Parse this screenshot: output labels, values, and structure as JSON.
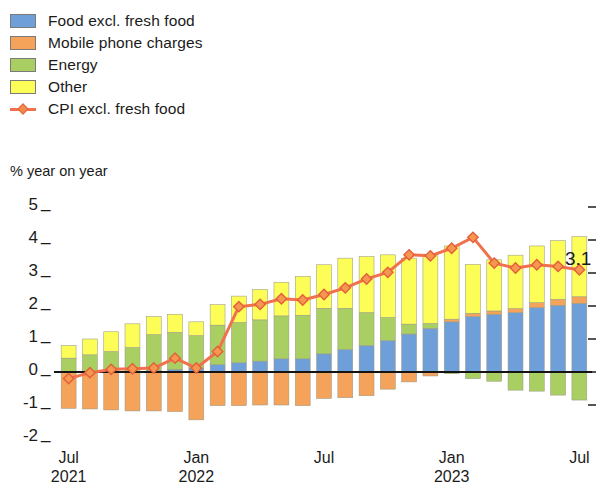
{
  "legend": {
    "items": [
      {
        "label": "Food excl. fresh food",
        "color": "#6f9fd8",
        "type": "swatch",
        "icon": "square-swatch-icon"
      },
      {
        "label": "Mobile phone charges",
        "color": "#f5a25a",
        "type": "swatch",
        "icon": "square-swatch-icon"
      },
      {
        "label": "Energy",
        "color": "#a9cf63",
        "type": "swatch",
        "icon": "square-swatch-icon"
      },
      {
        "label": "Other",
        "color": "#fdfd57",
        "type": "swatch",
        "icon": "square-swatch-icon"
      },
      {
        "label": "CPI excl. fresh food",
        "color": "#f0714c",
        "type": "line",
        "icon": "line-marker-icon"
      }
    ]
  },
  "chart_data": {
    "type": "bar",
    "subtype": "stacked-bar-with-line-overlay",
    "title": "",
    "subtitle": "",
    "ylabel": "% year on year",
    "xlabel": "",
    "ylim": [
      -2,
      5
    ],
    "yticks": [
      -2,
      -1,
      0,
      1,
      2,
      3,
      4,
      5
    ],
    "ytick_labels": [
      "-2",
      "-1",
      "0",
      "1",
      "2",
      "3",
      "4",
      "5"
    ],
    "grid": false,
    "zero_line": true,
    "legend_position": "top-left",
    "x": [
      "2021-07",
      "2021-08",
      "2021-09",
      "2021-10",
      "2021-11",
      "2021-12",
      "2022-01",
      "2022-02",
      "2022-03",
      "2022-04",
      "2022-05",
      "2022-06",
      "2022-07",
      "2022-08",
      "2022-09",
      "2022-10",
      "2022-11",
      "2022-12",
      "2023-01",
      "2023-02",
      "2023-03",
      "2023-04",
      "2023-05",
      "2023-06",
      "2023-07"
    ],
    "xtick_positions": [
      0,
      6,
      12,
      18,
      24
    ],
    "xtick_labels": [
      {
        "month": "Jul",
        "year": "2021"
      },
      {
        "month": "Jan",
        "year": "2022"
      },
      {
        "month": "Jul",
        "year": ""
      },
      {
        "month": "Jan",
        "year": "2023"
      },
      {
        "month": "Jul",
        "year": ""
      }
    ],
    "series": [
      {
        "name": "Food excl. fresh food",
        "color": "#6f9fd8",
        "values": [
          0.0,
          0.0,
          0.0,
          0.02,
          0.05,
          0.08,
          0.12,
          0.22,
          0.28,
          0.33,
          0.4,
          0.4,
          0.55,
          0.68,
          0.8,
          0.95,
          1.15,
          1.32,
          1.52,
          1.68,
          1.75,
          1.8,
          1.95,
          2.02,
          2.08
        ]
      },
      {
        "name": "Mobile phone charges",
        "color": "#f5a25a",
        "values": [
          -1.1,
          -1.12,
          -1.15,
          -1.18,
          -1.18,
          -1.2,
          -1.45,
          -1.02,
          -1.02,
          -1.0,
          -1.0,
          -1.02,
          -0.8,
          -0.78,
          -0.72,
          -0.52,
          -0.3,
          -0.12,
          0.08,
          0.1,
          0.1,
          0.12,
          0.15,
          0.18,
          0.2
        ]
      },
      {
        "name": "Energy",
        "color": "#a9cf63",
        "values": [
          0.42,
          0.52,
          0.62,
          0.72,
          1.08,
          1.12,
          0.98,
          1.2,
          1.22,
          1.25,
          1.3,
          1.32,
          1.38,
          1.25,
          1.0,
          0.7,
          0.3,
          0.15,
          -0.05,
          -0.2,
          -0.28,
          -0.55,
          -0.58,
          -0.7,
          -0.85
        ]
      },
      {
        "name": "Other",
        "color": "#fdfd57",
        "values": [
          0.38,
          0.48,
          0.6,
          0.72,
          0.55,
          0.55,
          0.42,
          0.62,
          0.8,
          0.92,
          1.02,
          1.18,
          1.32,
          1.52,
          1.7,
          1.9,
          2.0,
          2.1,
          2.22,
          1.48,
          1.55,
          1.62,
          1.72,
          1.78,
          1.82
        ]
      }
    ],
    "line_series": {
      "name": "CPI excl. fresh food",
      "color": "#f0714c",
      "marker": "diamond",
      "values": [
        -0.2,
        -0.02,
        0.08,
        0.1,
        0.12,
        0.42,
        0.12,
        0.62,
        1.98,
        2.05,
        2.22,
        2.18,
        2.35,
        2.55,
        2.82,
        3.02,
        3.55,
        3.52,
        3.75,
        4.08,
        3.3,
        3.15,
        3.25,
        3.2,
        3.1
      ]
    },
    "annotations": [
      {
        "text": "3.1",
        "x_index": 24,
        "y_value": 3.1,
        "name": "last-value-label"
      }
    ]
  }
}
